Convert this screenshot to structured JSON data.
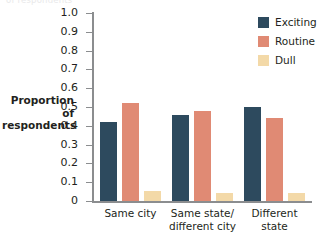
{
  "chart_data": {
    "type": "bar",
    "title": "",
    "xlabel": "",
    "ylabel": "Proportion of respondents",
    "ylabel_lines": [
      "Proportion of",
      "respondents"
    ],
    "ylim": [
      0,
      1.0
    ],
    "grid": false,
    "legend_position": "top-right",
    "categories": [
      "Same city",
      "Same state/ different city",
      "Different state"
    ],
    "category_lines": [
      [
        "Same city"
      ],
      [
        "Same state/",
        "different city"
      ],
      [
        "Different",
        "state"
      ]
    ],
    "ytick_labels": [
      "1.0",
      "0.9",
      "0.8",
      "0.7",
      "0.6",
      "0.5",
      "0.4",
      "0.3",
      "0.2",
      "0.1",
      "0"
    ],
    "ytick_values": [
      1.0,
      0.9,
      0.8,
      0.7,
      0.6,
      0.5,
      0.4,
      0.3,
      0.2,
      0.1,
      0
    ],
    "series": [
      {
        "name": "Exciting",
        "color": "#2d4a5e",
        "values": [
          0.42,
          0.46,
          0.5
        ]
      },
      {
        "name": "Routine",
        "color": "#e08a74",
        "values": [
          0.52,
          0.48,
          0.44
        ]
      },
      {
        "name": "Dull",
        "color": "#f3d9a8",
        "values": [
          0.055,
          0.045,
          0.04
        ]
      }
    ]
  },
  "legend": {
    "items": [
      {
        "label": "Exciting",
        "color": "#2d4a5e"
      },
      {
        "label": "Routine",
        "color": "#e08a74"
      },
      {
        "label": "Dull",
        "color": "#f3d9a8"
      }
    ]
  },
  "top_clipped_text": "of respondents"
}
